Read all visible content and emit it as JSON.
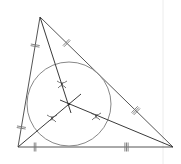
{
  "diagram": {
    "colors": {
      "edge": "#555555",
      "bisector": "#3a3a3a",
      "circle": "#888888",
      "tick": "#777777"
    },
    "vertices": [
      {
        "id": "top",
        "x": 40,
        "y": 17
      },
      {
        "id": "bottom-left",
        "x": 18,
        "y": 147
      },
      {
        "id": "bottom-right",
        "x": 173,
        "y": 147
      }
    ],
    "incircle": {
      "cx": 69,
      "cy": 104,
      "r": 42
    },
    "bisectors": [
      {
        "from": "top",
        "to": [
          71,
          113
        ]
      },
      {
        "from": "bottom-left",
        "to": [
          81,
          94
        ]
      },
      {
        "from": "bottom-right",
        "to": [
          60,
          100
        ]
      }
    ],
    "arc_marks": [
      {
        "x": 62,
        "y": 84
      },
      {
        "x": 52,
        "y": 118
      },
      {
        "x": 96,
        "y": 116
      }
    ],
    "equal_segment_marks": [
      {
        "side": "left",
        "position": 0.22,
        "count": 2
      },
      {
        "side": "left",
        "position": 0.85,
        "count": 2
      },
      {
        "side": "right",
        "position": 0.2,
        "count": 2
      },
      {
        "side": "right",
        "position": 0.72,
        "count": 3
      },
      {
        "side": "bottom",
        "position": 0.11,
        "count": 2
      },
      {
        "side": "bottom",
        "position": 0.7,
        "count": 3
      }
    ]
  }
}
